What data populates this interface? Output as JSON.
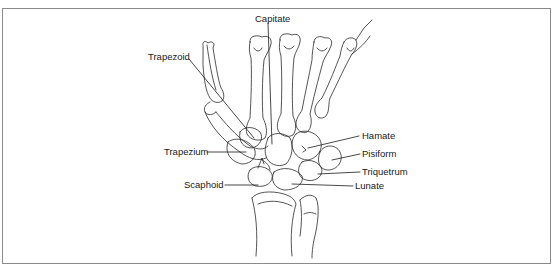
{
  "figure": {
    "type": "anatomical-illustration",
    "labels": [
      {
        "id": "capitate",
        "text": "Capitate",
        "x": 255,
        "y": 16
      },
      {
        "id": "trapezoid",
        "text": "Trapezoid",
        "x": 148,
        "y": 54
      },
      {
        "id": "hamate",
        "text": "Hamate",
        "x": 361,
        "y": 133
      },
      {
        "id": "trapezium",
        "text": "Trapezium",
        "x": 164,
        "y": 149
      },
      {
        "id": "pisiform",
        "text": "Pisiform",
        "x": 362,
        "y": 151
      },
      {
        "id": "triquetrum",
        "text": "Triquetrum",
        "x": 362,
        "y": 169
      },
      {
        "id": "scaphoid",
        "text": "Scaphoid",
        "x": 184,
        "y": 181
      },
      {
        "id": "lunate",
        "text": "Lunate",
        "x": 355,
        "y": 183
      }
    ],
    "colors": {
      "line": "#2a2a2a",
      "frame": "#8a8a8a",
      "text": "#1a1a1a"
    }
  }
}
